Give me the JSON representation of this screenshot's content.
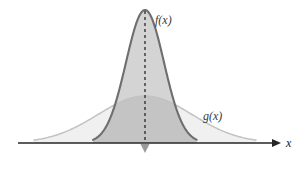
{
  "figure": {
    "background_color": "#ffffff",
    "width": 304,
    "height": 169
  },
  "axis": {
    "x_label": "x",
    "line_color": "#262626",
    "baseline_y": 143,
    "start_x": 18,
    "end_x": 272,
    "arrowhead": "right-arrow-icon"
  },
  "center_marker": {
    "name": "mean-marker",
    "shape": "down-triangle",
    "color": "#9a9a9a",
    "x": 145
  },
  "dashed_line": {
    "name": "center-axis-of-symmetry",
    "color": "#1a1a1a",
    "dash": "3 3",
    "x": 145
  },
  "curves": [
    {
      "key": "f",
      "label": "f(x)",
      "label_x": 155,
      "label_y": 24,
      "description": "narrow tall bell curve",
      "fill_color": "#d4d4d4",
      "stroke_color": "#6e6e6e",
      "stroke_width": 2.1,
      "peak_x": 145,
      "peak_y": 10,
      "sigma": 19
    },
    {
      "key": "g",
      "label": "g(x)",
      "label_x": 203,
      "label_y": 120,
      "description": "wide flat bell curve",
      "fill_color": "#f0f0f0",
      "stroke_color": "#c2c2c2",
      "stroke_width": 1.5,
      "peak_x": 145,
      "peak_y": 96,
      "sigma": 47
    }
  ],
  "overlap": {
    "name": "overlap-region",
    "fill_color": "#c4c4c4"
  },
  "chart_data": {
    "type": "line",
    "xlabel": "x",
    "ylabel": "",
    "grid": false,
    "legend": "inline-annotations",
    "annotations": [
      "f(x)",
      "g(x)"
    ],
    "x": [
      -4,
      -3.5,
      -3,
      -2.5,
      -2,
      -1.5,
      -1,
      -0.5,
      0,
      0.5,
      1,
      1.5,
      2,
      2.5,
      3,
      3.5,
      4
    ],
    "series": [
      {
        "name": "f(x)",
        "mean": 0,
        "sigma": 0.75,
        "peak_value": 1.0,
        "values": [
          0.0,
          0.0,
          0.0,
          0.0,
          0.03,
          0.14,
          0.41,
          0.8,
          1.0,
          0.8,
          0.41,
          0.14,
          0.03,
          0.0,
          0.0,
          0.0,
          0.0
        ]
      },
      {
        "name": "g(x)",
        "mean": 0,
        "sigma": 1.85,
        "peak_value": 0.36,
        "values": [
          0.03,
          0.06,
          0.1,
          0.15,
          0.21,
          0.26,
          0.31,
          0.35,
          0.36,
          0.35,
          0.31,
          0.26,
          0.21,
          0.15,
          0.1,
          0.06,
          0.03
        ]
      }
    ],
    "xlim": [
      -4.4,
      4.6
    ],
    "ylim": [
      0,
      1.12
    ]
  }
}
